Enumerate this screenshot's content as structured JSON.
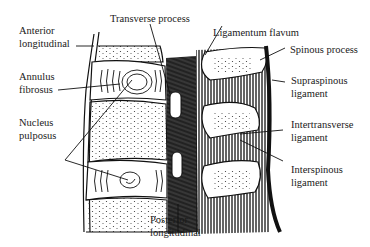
{
  "diagram": {
    "type": "anatomical-illustration",
    "labels": {
      "anterior_longitudinal": [
        "Anterior",
        "longitudinal"
      ],
      "annulus_fibrosus": [
        "Annulus",
        "fibrosus"
      ],
      "nucleus_pulposus": [
        "Nucleus",
        "pulposus"
      ],
      "transverse_process": [
        "Transverse process"
      ],
      "ligamentum_flavum": [
        "Ligamentum flavum"
      ],
      "spinous_process": [
        "Spinous process"
      ],
      "supraspinous_ligament": [
        "Supraspinous",
        "ligament"
      ],
      "intertransverse_ligament": [
        "Intertransverse",
        "ligament"
      ],
      "interspinous_ligament": [
        "Interspinous",
        "ligament"
      ],
      "posterior_longitudinal": [
        "Posterior",
        "longitudinal"
      ]
    }
  }
}
